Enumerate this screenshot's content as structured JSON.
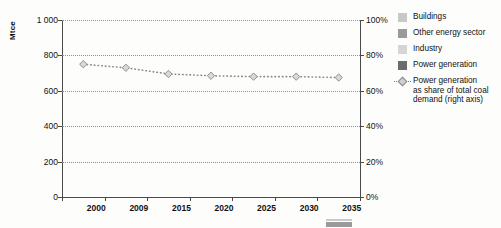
{
  "chart_data": {
    "type": "bar",
    "title": "",
    "subtitle": "",
    "xlabel": "",
    "ylabel": "Mtce",
    "categories": [
      "2000",
      "2009",
      "2015",
      "2020",
      "2025",
      "2030",
      "2035"
    ],
    "ylim": [
      0,
      1000
    ],
    "yticks": [
      0,
      200,
      400,
      600,
      800,
      1000
    ],
    "ytick_labels": [
      "0",
      "200",
      "400",
      "600",
      "800",
      "1 000"
    ],
    "y2lim": [
      0,
      100
    ],
    "y2ticks": [
      0,
      20,
      40,
      60,
      80,
      100
    ],
    "y2tick_labels": [
      "0%",
      "20%",
      "40%",
      "60%",
      "80%",
      "100%"
    ],
    "y2label": "",
    "grid": true,
    "legend_position": "right",
    "stacked": true,
    "series": [
      {
        "name": "Power generation",
        "kind": "bar",
        "color": "#6b6b6b",
        "values": [
          178,
          292,
          356,
          420,
          473,
          522,
          598
        ]
      },
      {
        "name": "Industry",
        "kind": "bar",
        "color": "#d5d5d5",
        "values": [
          30,
          64,
          110,
          130,
          152,
          205,
          232
        ]
      },
      {
        "name": "Other energy sector",
        "kind": "bar",
        "color": "#9a9a9a",
        "values": [
          18,
          22,
          38,
          55,
          55,
          30,
          32
        ]
      },
      {
        "name": "Buildings",
        "kind": "bar",
        "color": "#c8c8c8",
        "values": [
          16,
          12,
          16,
          18,
          18,
          22,
          22
        ]
      },
      {
        "name": "Power generation as share of total coal demand (right axis)",
        "kind": "line",
        "axis": "right",
        "color": "#8a8a8a",
        "marker": "diamond",
        "linestyle": "dotted",
        "values": [
          75,
          73,
          69.5,
          68.5,
          68,
          68,
          67.5
        ]
      }
    ],
    "totals": [
      242,
      390,
      520,
      623,
      698,
      779,
      884
    ]
  },
  "legend": {
    "entries": [
      {
        "label": "Buildings",
        "color": "#c8c8c8",
        "type": "swatch"
      },
      {
        "label": "Other energy sector",
        "color": "#9a9a9a",
        "type": "swatch"
      },
      {
        "label": "Industry",
        "color": "#d5d5d5",
        "type": "swatch"
      },
      {
        "label": "Power generation",
        "color": "#6b6b6b",
        "type": "swatch"
      },
      {
        "label": "Power generation\nas share of total coal\ndemand (right axis)",
        "color": "#cfcfcf",
        "type": "line-marker"
      }
    ]
  },
  "axes": {
    "left_unit": "Mtce"
  },
  "colors": {
    "power_generation": "#6b6b6b",
    "industry": "#d5d5d5",
    "other_energy_sector": "#9a9a9a",
    "buildings": "#c8c8c8",
    "line": "#8a8a8a",
    "grid": "#8e8e8e",
    "axis": "#4a4a4a",
    "background": "#fdfdfb"
  }
}
